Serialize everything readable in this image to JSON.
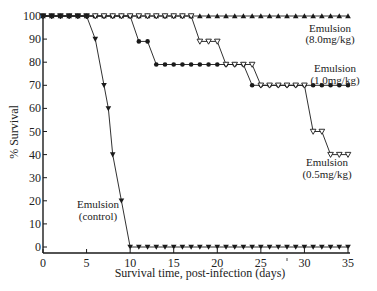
{
  "chart_data": {
    "type": "line",
    "title": "",
    "xlabel": "Survival time, post-infection (days)",
    "ylabel": "% Survival",
    "xlim": [
      0,
      35
    ],
    "ylim": [
      0,
      100
    ],
    "xticks": [
      0,
      5,
      10,
      15,
      20,
      25,
      30,
      35
    ],
    "yticks": [
      0,
      10,
      20,
      30,
      40,
      50,
      60,
      70,
      80,
      90,
      100
    ],
    "grid": false,
    "legend": "inline annotations",
    "series": [
      {
        "name": "Emulsion (8.0mg/kg)",
        "marker": "filled-triangle-up",
        "x": [
          0,
          1,
          2,
          3,
          4,
          5,
          6,
          7,
          8,
          9,
          10,
          11,
          12,
          13,
          14,
          15,
          16,
          17,
          18,
          19,
          20,
          21,
          22,
          23,
          24,
          25,
          26,
          27,
          28,
          29,
          30,
          31,
          32,
          33,
          34,
          35
        ],
        "values": [
          100,
          100,
          100,
          100,
          100,
          100,
          100,
          100,
          100,
          100,
          100,
          100,
          100,
          100,
          100,
          100,
          100,
          100,
          100,
          100,
          100,
          100,
          100,
          100,
          100,
          100,
          100,
          100,
          100,
          100,
          100,
          100,
          100,
          100,
          100,
          100
        ]
      },
      {
        "name": "Emulsion (1.0mg/kg)",
        "marker": "filled-circle",
        "x": [
          0,
          1,
          2,
          3,
          4,
          5,
          6,
          7,
          8,
          9,
          10,
          11,
          12,
          13,
          14,
          15,
          16,
          17,
          18,
          19,
          20,
          21,
          22,
          23,
          24,
          25,
          26,
          27,
          28,
          29,
          30,
          31,
          32,
          33,
          34,
          35
        ],
        "values": [
          100,
          100,
          100,
          100,
          100,
          100,
          100,
          100,
          100,
          100,
          100,
          89,
          89,
          79,
          79,
          79,
          79,
          79,
          79,
          79,
          79,
          79,
          79,
          79,
          70,
          70,
          70,
          70,
          70,
          70,
          70,
          70,
          70,
          70,
          70,
          70
        ]
      },
      {
        "name": "Emulsion (0.5mg/kg)",
        "marker": "open-triangle-down",
        "x": [
          0,
          1,
          2,
          3,
          4,
          5,
          6,
          7,
          8,
          9,
          10,
          11,
          12,
          13,
          14,
          15,
          16,
          17,
          18,
          19,
          20,
          21,
          22,
          23,
          24,
          25,
          26,
          27,
          28,
          29,
          30,
          31,
          32,
          33,
          34,
          35
        ],
        "values": [
          100,
          100,
          100,
          100,
          100,
          100,
          100,
          100,
          100,
          100,
          100,
          100,
          100,
          100,
          100,
          100,
          100,
          100,
          89,
          89,
          89,
          79,
          79,
          79,
          79,
          70,
          70,
          70,
          70,
          70,
          70,
          50,
          50,
          40,
          40,
          40
        ]
      },
      {
        "name": "Emulsion (control)",
        "marker": "filled-triangle-down",
        "x": [
          0,
          1,
          2,
          3,
          4,
          5,
          6,
          7,
          7.5,
          8,
          9,
          10,
          11,
          12,
          13,
          14,
          15,
          16,
          17,
          18,
          19,
          20,
          21,
          22,
          23,
          24,
          25,
          26,
          27,
          28,
          29,
          30,
          31,
          32,
          33,
          34,
          35
        ],
        "values": [
          100,
          100,
          100,
          100,
          100,
          100,
          90,
          70,
          60,
          40,
          20,
          0,
          0,
          0,
          0,
          0,
          0,
          0,
          0,
          0,
          0,
          0,
          0,
          0,
          0,
          0,
          0,
          0,
          0,
          0,
          0,
          0,
          0,
          0,
          0,
          0,
          0
        ]
      }
    ],
    "annotations": [
      {
        "series": "Emulsion (8.0mg/kg)",
        "line1": "Emulsion",
        "line2": "(8.0mg/kg)"
      },
      {
        "series": "Emulsion (1.0mg/kg)",
        "line1": "Emulsion",
        "line2": "(1.0mg/kg)"
      },
      {
        "series": "Emulsion (0.5mg/kg)",
        "line1": "Emulsion",
        "line2": "(0.5mg/kg)"
      },
      {
        "series": "Emulsion (control)",
        "line1": "Emulsion",
        "line2": "(control)"
      }
    ]
  },
  "colors": {
    "ink": "#1a1a1a",
    "background": "#ffffff"
  }
}
